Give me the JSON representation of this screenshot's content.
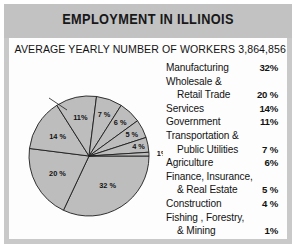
{
  "card": {
    "title": "EMPLOYMENT IN ILLINOIS",
    "subtitle": "AVERAGE YEARLY NUMBER OF WORKERS  3,864,856",
    "total_workers": "3,864,856"
  },
  "legend": {
    "rows": [
      {
        "lines": [
          "Manufacturing"
        ],
        "pct": "32%"
      },
      {
        "lines": [
          "Wholesale &",
          "Retail Trade"
        ],
        "pct": "20 %"
      },
      {
        "lines": [
          "Services"
        ],
        "pct": "14%"
      },
      {
        "lines": [
          "Government"
        ],
        "pct": "11%"
      },
      {
        "lines": [
          "Transportation &",
          "Public Utilities"
        ],
        "pct": "7 %"
      },
      {
        "lines": [
          "Agriculture"
        ],
        "pct": "6%"
      },
      {
        "lines": [
          "Finance, Insurance,",
          "& Real Estate"
        ],
        "pct": "5 %"
      },
      {
        "lines": [
          "Construction"
        ],
        "pct": "4 %"
      },
      {
        "lines": [
          "Fishing , Forestry,",
          "& Mining"
        ],
        "pct": "1%"
      }
    ]
  },
  "chart_data": {
    "type": "pie",
    "title": "EMPLOYMENT IN ILLINOIS",
    "subtitle": "AVERAGE YEARLY NUMBER OF WORKERS  3,864,856",
    "categories": [
      "Manufacturing",
      "Wholesale & Retail Trade",
      "Services",
      "Government",
      "Transportation & Public Utilities",
      "Agriculture",
      "Finance, Insurance, & Real Estate",
      "Construction",
      "Fishing, Forestry, & Mining"
    ],
    "values": [
      32,
      20,
      14,
      11,
      7,
      6,
      5,
      4,
      1
    ],
    "slice_labels": [
      "32 %",
      "20 %",
      "14 %",
      "11%",
      "7 %",
      "6 %",
      "5 %",
      "4 %",
      "1%"
    ],
    "units": "percent of workers",
    "start_angle_deg": 0,
    "direction": "clockwise",
    "legend_position": "right",
    "colors": {
      "slice_fill": "#bdbdbd",
      "slice_stroke": "#1d1d1d",
      "panel_background": "#fdfdfd",
      "card_background": "#c9c9c9",
      "title_band": "#c2c2c2",
      "text": "#121212"
    }
  }
}
